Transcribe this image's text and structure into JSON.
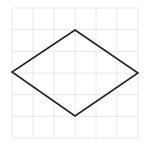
{
  "diagram": {
    "background": "#ffffff",
    "grid": {
      "x0": 12,
      "y0": 8,
      "x1": 138,
      "y1": 138,
      "cols": 6,
      "rows": 6,
      "color": "#e8e8e8"
    },
    "shape": {
      "type": "diamond",
      "points": [
        [
          75,
          30
        ],
        [
          138,
          73
        ],
        [
          75,
          116
        ],
        [
          12,
          72
        ]
      ],
      "stroke": "#222222",
      "stroke_width": 1.6,
      "fill": "none"
    }
  }
}
